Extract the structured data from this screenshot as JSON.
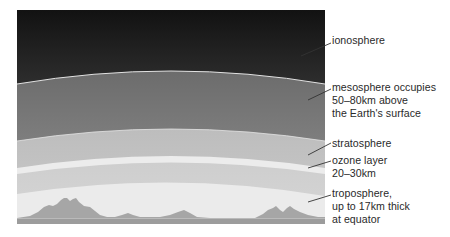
{
  "diagram": {
    "colors": {
      "ionosphere_top": "#141414",
      "ionosphere_bottom": "#5e5e5e",
      "mesosphere_top": "#6a6a6a",
      "mesosphere_bottom": "#8e8e8e",
      "stratosphere": "#c4c4c4",
      "ozone_layer": "#ececec",
      "lower_stratosphere": "#d0d0d0",
      "troposphere": "#ebebeb",
      "mountains": "#a4a4a4",
      "ground": "#9a9a9a",
      "boundary_line": "#e8e8e8",
      "leader_line": "#333333",
      "label_text": "#2a2a2a"
    },
    "layers": [
      {
        "id": "ionosphere",
        "label": "ionosphere"
      },
      {
        "id": "mesosphere",
        "label": "mesosphere occupies\n50–80km above\nthe Earth's surface",
        "lines": [
          "mesosphere occupies",
          "50–80km above",
          "the Earth's surface"
        ]
      },
      {
        "id": "stratosphere",
        "label": "stratosphere"
      },
      {
        "id": "ozone",
        "label": "ozone layer\n20–30km",
        "lines": [
          "ozone layer",
          "20–30km"
        ]
      },
      {
        "id": "troposphere",
        "label": "troposphere,\nup to 17km thick\nat equator",
        "lines": [
          "troposphere,",
          "up to 17km thick",
          "at equator"
        ]
      }
    ]
  }
}
